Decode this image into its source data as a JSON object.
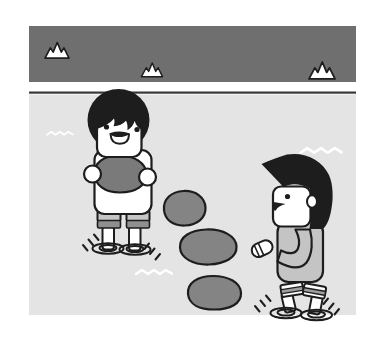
{
  "illustration": {
    "kind": "cartoon-scene",
    "subject": "two children crossing a stream on stepping stones; left child holds a stone, right child walks toward the stones"
  },
  "scene": {
    "colors": {
      "page": "#ffffff",
      "ink": "#1d1d1d",
      "band": "#6f6f6f",
      "water": "#e4e4e4",
      "separator": "#383838",
      "stone": "#848484",
      "held_stone": "#7a7a7a",
      "sweater": "#c4c4c4",
      "shorts": "#c6c6c6",
      "shorts_stripe": "#8f8f8f",
      "cuff_stripe": "#9e9e9e",
      "white": "#ffffff"
    },
    "mountains": [
      {
        "x": 45,
        "y": 42.5,
        "scale": 1.2
      },
      {
        "x": 141.5,
        "y": 63,
        "scale": 1.05
      },
      {
        "x": 309,
        "y": 62,
        "scale": 1.3
      }
    ],
    "waves": [
      {
        "x": 47,
        "y": 131.5,
        "scale": 0.66
      },
      {
        "x": 300.5,
        "y": 147.5,
        "scale": 1.05
      },
      {
        "x": 136,
        "y": 269.5,
        "scale": 0.92
      }
    ],
    "ripples": [
      {
        "x": 108,
        "y": 248.5
      },
      {
        "x": 135,
        "y": 249.5
      },
      {
        "x": 286,
        "y": 313
      },
      {
        "x": 316.5,
        "y": 315
      }
    ],
    "splash_ticks": [
      {
        "x": 83,
        "y": 238,
        "flip": false
      },
      {
        "x": 160,
        "y": 247,
        "flip": true
      },
      {
        "x": 255,
        "y": 299,
        "flip": false
      },
      {
        "x": 339,
        "y": 302,
        "flip": true
      }
    ],
    "stepping_stones_count": 3,
    "characters": [
      {
        "id": "child-left",
        "pose": "standing, facing viewer, holding stone"
      },
      {
        "id": "child-right",
        "pose": "profile, walking left, arm reaching forward"
      }
    ]
  }
}
